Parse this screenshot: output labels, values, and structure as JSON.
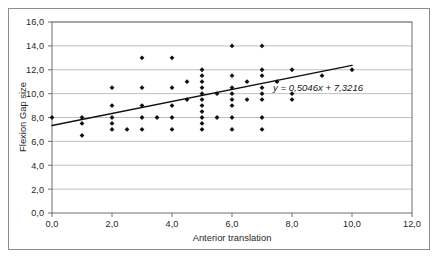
{
  "chart_data": {
    "type": "scatter",
    "title": "",
    "xlabel": "Anterior translation",
    "ylabel": "Flexion Gap size",
    "xlim": [
      0,
      12
    ],
    "ylim": [
      0,
      16
    ],
    "xticks": [
      "0,0",
      "2,0",
      "4,0",
      "6,0",
      "8,0",
      "10,0",
      "12,0"
    ],
    "yticks": [
      "0,0",
      "2,0",
      "4,0",
      "6,0",
      "8,0",
      "10,0",
      "12,0",
      "14,0",
      "16,0"
    ],
    "xtick_values": [
      0,
      2,
      4,
      6,
      8,
      10,
      12
    ],
    "ytick_values": [
      0,
      2,
      4,
      6,
      8,
      10,
      12,
      14,
      16
    ],
    "grid": "horizontal",
    "legend": "none",
    "marker": "filled-diamond",
    "marker_color": "#111111",
    "trendline": {
      "equation_label": "y = 0,5046x + 7,3216",
      "slope": 0.5046,
      "intercept": 7.3216,
      "x_start": 0.0,
      "x_end": 10.0,
      "color": "#111111"
    },
    "points": [
      [
        0.0,
        8.0
      ],
      [
        1.0,
        8.0
      ],
      [
        1.0,
        7.5
      ],
      [
        1.0,
        6.5
      ],
      [
        2.0,
        10.5
      ],
      [
        2.0,
        9.0
      ],
      [
        2.0,
        8.0
      ],
      [
        2.0,
        7.5
      ],
      [
        2.0,
        7.0
      ],
      [
        2.5,
        7.0
      ],
      [
        3.0,
        13.0
      ],
      [
        3.0,
        10.5
      ],
      [
        3.0,
        9.0
      ],
      [
        3.0,
        8.0
      ],
      [
        3.0,
        7.0
      ],
      [
        3.5,
        8.0
      ],
      [
        4.0,
        13.0
      ],
      [
        4.0,
        10.5
      ],
      [
        4.0,
        9.0
      ],
      [
        4.0,
        8.0
      ],
      [
        4.0,
        7.0
      ],
      [
        4.5,
        9.5
      ],
      [
        4.5,
        11.0
      ],
      [
        5.0,
        12.0
      ],
      [
        5.0,
        11.5
      ],
      [
        5.0,
        11.0
      ],
      [
        5.0,
        10.5
      ],
      [
        5.0,
        10.0
      ],
      [
        5.0,
        9.5
      ],
      [
        5.0,
        9.0
      ],
      [
        5.0,
        8.5
      ],
      [
        5.0,
        8.0
      ],
      [
        5.0,
        7.5
      ],
      [
        5.0,
        7.0
      ],
      [
        5.5,
        10.0
      ],
      [
        5.5,
        8.0
      ],
      [
        6.0,
        14.0
      ],
      [
        6.0,
        11.5
      ],
      [
        6.0,
        10.5
      ],
      [
        6.0,
        10.0
      ],
      [
        6.0,
        9.5
      ],
      [
        6.0,
        9.0
      ],
      [
        6.0,
        8.0
      ],
      [
        6.0,
        7.0
      ],
      [
        6.5,
        11.0
      ],
      [
        6.5,
        9.5
      ],
      [
        7.0,
        14.0
      ],
      [
        7.0,
        12.0
      ],
      [
        7.0,
        11.5
      ],
      [
        7.0,
        10.5
      ],
      [
        7.0,
        10.0
      ],
      [
        7.0,
        9.5
      ],
      [
        7.0,
        8.0
      ],
      [
        7.0,
        7.0
      ],
      [
        7.5,
        11.0
      ],
      [
        8.0,
        12.0
      ],
      [
        8.0,
        10.0
      ],
      [
        8.0,
        9.5
      ],
      [
        9.0,
        11.5
      ],
      [
        10.0,
        12.0
      ]
    ]
  },
  "frame": {
    "outer_border_color": "#8d8d8d",
    "plot_border_color": "#6e6e6e",
    "gridline_color": "#b9b9b9",
    "background": "#ffffff"
  }
}
